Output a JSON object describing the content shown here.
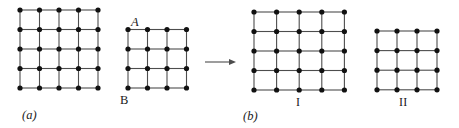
{
  "figure": {
    "caption_a": "(a)",
    "caption_b": "(b)",
    "label_a_node": "A",
    "label_b_node": "B",
    "label_part_one": "I",
    "label_part_two": "II",
    "arrow_icon": "right-arrow-icon",
    "colors": {
      "edge": "#4d4d4d",
      "node": "#111111",
      "text": "#1a1a1a",
      "background": "#ffffff"
    },
    "geometry": {
      "node_radius": 2.6,
      "edge_width": 1.1,
      "graph_a": {
        "left_block": {
          "x0": 20,
          "y0": 10,
          "cols": 4,
          "rows": 4,
          "dx": 19.5,
          "dy": 19.5
        },
        "right_block": {
          "x0": 128,
          "y0": 29.5,
          "cols": 3,
          "rows": 3,
          "dx": 19.5,
          "dy": 19.5
        }
      },
      "arrow": {
        "x1": 205,
        "x2": 236,
        "y": 62,
        "head": 7
      },
      "graph_b": {
        "part_one": {
          "x0": 254,
          "y0": 12,
          "cols": 4,
          "rows": 4,
          "dx": 22.6,
          "dy": 19.5
        },
        "part_two": {
          "x0": 377,
          "y0": 31,
          "cols": 3,
          "rows": 3,
          "dx": 20,
          "dy": 19.6
        }
      }
    }
  },
  "chart_data": {
    "type": "diagram",
    "graphs": [
      {
        "id": "a",
        "caption": "(a)",
        "shape": "L-shaped lattice",
        "node_labels": [
          "A",
          "B"
        ],
        "blocks": [
          {
            "name": "upper-left block",
            "node_cols": 5,
            "node_rows": 5,
            "cell_cols": 4,
            "cell_rows": 4
          },
          {
            "name": "lower-right block",
            "node_cols": 4,
            "node_rows": 4,
            "cell_cols": 3,
            "cell_rows": 3
          }
        ],
        "total_nodes": 41,
        "notes": "The two blocks share the vertical column of 4 nodes at the junction directly below label A."
      },
      {
        "id": "b-I",
        "caption": "I",
        "shape": "rectangular lattice",
        "node_cols": 5,
        "node_rows": 5,
        "cell_cols": 4,
        "cell_rows": 4,
        "total_nodes": 25
      },
      {
        "id": "b-II",
        "caption": "II",
        "shape": "rectangular lattice",
        "node_cols": 4,
        "node_rows": 4,
        "cell_cols": 3,
        "cell_rows": 3,
        "total_nodes": 16
      }
    ],
    "transformation": {
      "symbol": "→",
      "from": "(a)",
      "to": [
        "I",
        "II"
      ]
    }
  }
}
